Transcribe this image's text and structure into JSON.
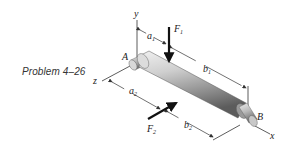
{
  "caption": "Problem 4–26",
  "labels": {
    "y_axis": "y",
    "z_axis": "z",
    "x_axis": "x",
    "point_a": "A",
    "point_b": "B",
    "force_1": {
      "base": "F",
      "sub": "1"
    },
    "force_2": {
      "base": "F",
      "sub": "2"
    },
    "dim_a1": {
      "base": "a",
      "sub": "1"
    },
    "dim_b1": {
      "base": "b",
      "sub": "1"
    },
    "dim_a2": {
      "base": "a",
      "sub": "2"
    },
    "dim_b2": {
      "base": "b",
      "sub": "2"
    }
  },
  "colors": {
    "line": "#333333",
    "shaft_light": "#e6e6e6",
    "shaft_mid": "#b3b3b3",
    "shaft_dark": "#6e6e6e",
    "arrow": "#111111"
  }
}
